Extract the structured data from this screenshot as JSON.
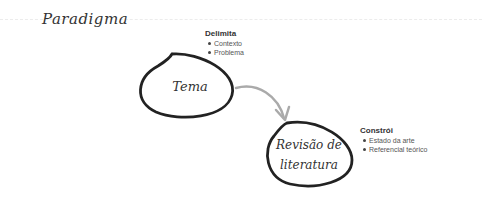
{
  "title": "Paradigma",
  "nodes": [
    {
      "label": "Tema"
    },
    {
      "label_line1": "Revisão de",
      "label_line2": "literatura"
    }
  ],
  "notes": [
    {
      "heading": "Delimita",
      "items": [
        "Contexto",
        "Problema"
      ]
    },
    {
      "heading": "Constrói",
      "items": [
        "Estado da arte",
        "Referencial teórico"
      ]
    }
  ],
  "colors": {
    "ink": "#222222",
    "arrow": "#a8a8a8"
  }
}
